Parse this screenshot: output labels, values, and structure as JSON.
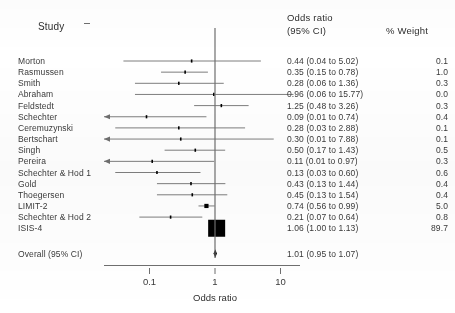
{
  "header": {
    "study_label": "Study",
    "or_line1": "Odds ratio",
    "or_line2": "(95% CI)",
    "weight_label": "% Weight"
  },
  "axis": {
    "title": "Odds ratio",
    "ticks": [
      "0.1",
      "1",
      "10"
    ]
  },
  "summary_row": {
    "label": "Overall (95% CI)",
    "or_text": "1.01 (0.95 to 1.07)",
    "weight": ""
  },
  "chart_data": {
    "type": "forest",
    "title": "",
    "xlabel": "Odds ratio",
    "ylabel": "",
    "xscale": "log",
    "xlim": [
      0.01,
      30
    ],
    "xticks": [
      0.1,
      1,
      10
    ],
    "null_line": 1,
    "grid": false,
    "legend": "none",
    "columns": [
      "Study",
      "Odds ratio (95% CI)",
      "% Weight"
    ],
    "studies": [
      {
        "label": "Morton",
        "or": 0.44,
        "lo": 0.04,
        "hi": 5.02,
        "or_text": "0.44 (0.04 to 5.02)",
        "weight": 0.1,
        "weight_text": "0.1",
        "marker": "tick",
        "arrow_left": false
      },
      {
        "label": "Rasmussen",
        "or": 0.35,
        "lo": 0.15,
        "hi": 0.78,
        "or_text": "0.35 (0.15 to 0.78)",
        "weight": 1.0,
        "weight_text": "1.0",
        "marker": "tick",
        "arrow_left": false
      },
      {
        "label": "Smith",
        "or": 0.28,
        "lo": 0.06,
        "hi": 1.36,
        "or_text": "0.28 (0.06 to 1.36)",
        "weight": 0.3,
        "weight_text": "0.3",
        "marker": "tick",
        "arrow_left": false
      },
      {
        "label": "Abraham",
        "or": 0.96,
        "lo": 0.06,
        "hi": 15.77,
        "or_text": "0.96 (0.06 to 15.77)",
        "weight": 0.0,
        "weight_text": "0.0",
        "marker": "tick",
        "arrow_left": false
      },
      {
        "label": "Feldstedt",
        "or": 1.25,
        "lo": 0.48,
        "hi": 3.26,
        "or_text": "1.25 (0.48 to 3.26)",
        "weight": 0.3,
        "weight_text": "0.3",
        "marker": "tick",
        "arrow_left": false
      },
      {
        "label": "Schechter",
        "or": 0.09,
        "lo": 0.01,
        "hi": 0.74,
        "or_text": "0.09 (0.01 to 0.74)",
        "weight": 0.4,
        "weight_text": "0.4",
        "marker": "tick",
        "arrow_left": true
      },
      {
        "label": "Ceremuzynski",
        "or": 0.28,
        "lo": 0.03,
        "hi": 2.88,
        "or_text": "0.28 (0.03 to 2.88)",
        "weight": 0.1,
        "weight_text": "0.1",
        "marker": "tick",
        "arrow_left": false
      },
      {
        "label": "Bertschart",
        "or": 0.3,
        "lo": 0.01,
        "hi": 7.88,
        "or_text": "0.30 (0.01 to 7.88)",
        "weight": 0.1,
        "weight_text": "0.1",
        "marker": "tick",
        "arrow_left": false
      },
      {
        "label": "Singh",
        "or": 0.5,
        "lo": 0.17,
        "hi": 1.43,
        "or_text": "0.50 (0.17 to 1.43)",
        "weight": 0.5,
        "weight_text": "0.5",
        "marker": "tick",
        "arrow_left": false
      },
      {
        "label": "Pereira",
        "or": 0.11,
        "lo": 0.01,
        "hi": 0.97,
        "or_text": "0.11 (0.01 to 0.97)",
        "weight": 0.3,
        "weight_text": "0.3",
        "marker": "tick",
        "arrow_left": false
      },
      {
        "label": "Schechter & Hod 1",
        "or": 0.13,
        "lo": 0.03,
        "hi": 0.6,
        "or_text": "0.13 (0.03 to 0.60)",
        "weight": 0.6,
        "weight_text": "0.6",
        "marker": "tick",
        "arrow_left": false
      },
      {
        "label": "Gold",
        "or": 0.43,
        "lo": 0.13,
        "hi": 1.44,
        "or_text": "0.43 (0.13 to 1.44)",
        "weight": 0.4,
        "weight_text": "0.4",
        "marker": "tick",
        "arrow_left": false
      },
      {
        "label": "Thoegersen",
        "or": 0.45,
        "lo": 0.13,
        "hi": 1.54,
        "or_text": "0.45 (0.13 to 1.54)",
        "weight": 0.4,
        "weight_text": "0.4",
        "marker": "tick",
        "arrow_left": false
      },
      {
        "label": "LIMIT-2",
        "or": 0.74,
        "lo": 0.56,
        "hi": 0.99,
        "or_text": "0.74 (0.56 to 0.99)",
        "weight": 5.0,
        "weight_text": "5.0",
        "marker": "square",
        "arrow_left": false
      },
      {
        "label": "Schechter & Hod 2",
        "or": 0.21,
        "lo": 0.07,
        "hi": 0.64,
        "or_text": "0.21 (0.07 to 0.64)",
        "weight": 0.8,
        "weight_text": "0.8",
        "marker": "tick",
        "arrow_left": false
      },
      {
        "label": "ISIS-4",
        "or": 1.06,
        "lo": 1.0,
        "hi": 1.13,
        "or_text": "1.06 (1.00 to 1.13)",
        "weight": 89.7,
        "weight_text": "89.7",
        "marker": "bigsquare",
        "arrow_left": false
      }
    ],
    "overall": {
      "label": "Overall (95% CI)",
      "or": 1.01,
      "lo": 0.95,
      "hi": 1.07,
      "or_text": "1.01 (0.95 to 1.07)"
    }
  },
  "colors": {
    "ink": "#3a3a3a",
    "line": "#6f6f6f",
    "marker": "#000000",
    "axis": "#5a5a5a"
  }
}
